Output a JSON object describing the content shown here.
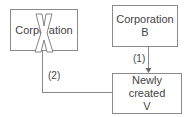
{
  "nodes": {
    "corp_a": {
      "label": "Corporation",
      "crossed_out": true
    },
    "corp_b": {
      "line1": "Corporation",
      "line2": "B"
    },
    "new_v": {
      "line1": "Newly created",
      "line2": "V"
    }
  },
  "edges": {
    "b_to_v": {
      "label": "(1)"
    },
    "a_to_v": {
      "label": "(2)"
    }
  },
  "colors": {
    "line": "#8a8a8a",
    "text": "#444444"
  }
}
